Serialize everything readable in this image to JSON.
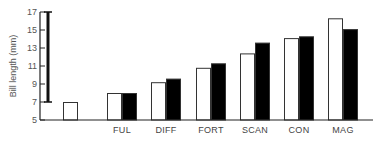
{
  "chart_data": {
    "type": "bar",
    "title": "",
    "xlabel": "",
    "ylabel": "Bill length (mm)",
    "ylim": [
      5,
      17
    ],
    "yticks": [
      5,
      7,
      9,
      11,
      13,
      15,
      17
    ],
    "grid": false,
    "legend": null,
    "categories": [
      "",
      "FUL",
      "DIFF",
      "FORT",
      "SCAN",
      "CON",
      "MAG"
    ],
    "series": [
      {
        "name": "white",
        "color": "#ffffff",
        "values": [
          7.0,
          8.0,
          9.2,
          10.8,
          12.4,
          14.1,
          16.3
        ]
      },
      {
        "name": "black",
        "color": "#000000",
        "values": [
          null,
          8.0,
          9.6,
          11.3,
          13.6,
          14.3,
          15.1
        ]
      }
    ],
    "range_bar": {
      "from": 7,
      "to": 17
    }
  }
}
